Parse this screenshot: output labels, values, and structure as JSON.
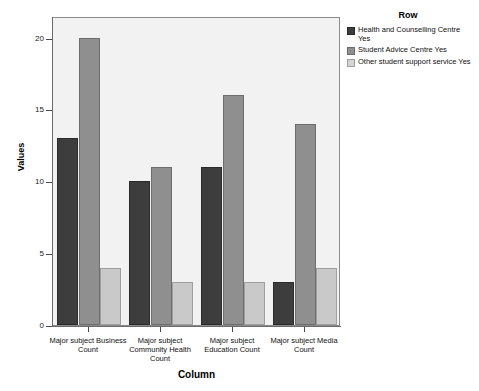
{
  "chart_data": {
    "type": "bar",
    "title": "",
    "xlabel": "Column",
    "ylabel": "Values",
    "ylim": [
      0,
      21.5
    ],
    "yticks": [
      0,
      5,
      10,
      15,
      20
    ],
    "grid": false,
    "legend_position": "right",
    "legend_title": "Row",
    "categories": [
      "Major subject Business Count",
      "Major subject Community Health Count",
      "Major subject Education Count",
      "Major subject Media Count"
    ],
    "series": [
      {
        "name": "Health and Counselling Centre Yes",
        "color": "#3d3d3d",
        "values": [
          13,
          10,
          11,
          3
        ]
      },
      {
        "name": "Student Advice Centre Yes",
        "color": "#8f8f8f",
        "values": [
          20,
          11,
          16,
          14
        ]
      },
      {
        "name": "Other student support service Yes",
        "color": "#c9c9c9",
        "values": [
          4,
          3,
          3,
          4
        ]
      }
    ]
  },
  "axes": {
    "y_title": "Values",
    "x_title": "Column",
    "y_tick_labels": [
      "0",
      "5",
      "10",
      "15",
      "20"
    ],
    "x_tick_labels": [
      "Major subject Business Count",
      "Major subject Community Health Count",
      "Major subject Education Count",
      "Major subject Media Count"
    ]
  },
  "legend": {
    "title": "Row",
    "items": [
      {
        "label": "Health and Counselling Centre Yes",
        "color": "#3d3d3d"
      },
      {
        "label": "Student Advice Centre Yes",
        "color": "#8f8f8f"
      },
      {
        "label": "Other student support service Yes",
        "color": "#c9c9c9"
      }
    ]
  }
}
